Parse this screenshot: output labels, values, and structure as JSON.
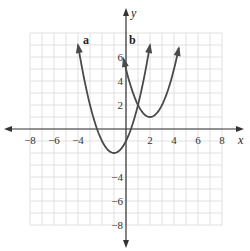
{
  "chart_data": {
    "type": "line",
    "title": "",
    "xlabel": "x",
    "ylabel": "y",
    "xlim": [
      -8,
      8
    ],
    "ylim": [
      -8,
      8
    ],
    "grid": true,
    "x_ticks": [
      "−8",
      "−6",
      "−4",
      "2",
      "4",
      "6",
      "8"
    ],
    "y_ticks": [
      "6",
      "4",
      "2",
      "−4",
      "−6",
      "−8"
    ],
    "series": [
      {
        "name": "a",
        "equation": "y = (x + 1)^2 - 2",
        "vertex": [
          -1,
          -2
        ],
        "x_range": [
          -4,
          2
        ]
      },
      {
        "name": "b",
        "equation": "y = (x - 2)^2 + 1",
        "vertex": [
          2,
          1
        ],
        "x_range": [
          -0.2,
          4.4
        ]
      }
    ]
  },
  "labels": {
    "x_axis": "x",
    "y_axis": "y",
    "curve_a": "a",
    "curve_b": "b"
  },
  "colors": {
    "grid": "#d9d9d9",
    "axis": "#333333",
    "curve": "#4a4a4a"
  }
}
